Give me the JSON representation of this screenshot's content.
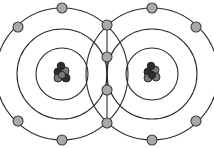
{
  "diagram": {
    "type": "covalent-bond-shell-diagram",
    "colors": {
      "shell_stroke": "#2a2a2a",
      "electron_fill": "#a9a9a9",
      "electron_stroke": "#3a3a3a",
      "nucleus_light": "#7a7a7a",
      "nucleus_dark": "#2e2e2e",
      "background": "#ffffff"
    },
    "atoms": [
      {
        "id": "left-atom",
        "center": [
          62,
          74
        ],
        "shell_radii": [
          26,
          45,
          66
        ],
        "outer_electrons": [
          [
            62,
            8
          ],
          [
            18,
            27
          ],
          [
            18,
            121
          ],
          [
            62,
            140
          ]
        ]
      },
      {
        "id": "right-atom",
        "center": [
          152,
          74
        ],
        "shell_radii": [
          26,
          45,
          66
        ],
        "outer_electrons": [
          [
            152,
            8
          ],
          [
            196,
            27
          ],
          [
            196,
            121
          ],
          [
            152,
            140
          ]
        ]
      }
    ],
    "shared_electrons": [
      [
        107,
        25
      ],
      [
        107,
        57
      ],
      [
        107,
        90
      ],
      [
        107,
        123
      ]
    ]
  }
}
